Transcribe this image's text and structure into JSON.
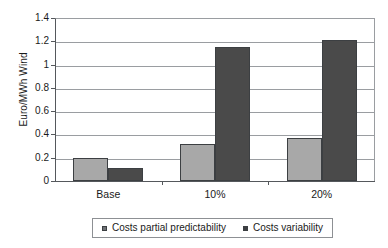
{
  "chart_data": {
    "type": "bar",
    "title": "",
    "subtitle": "",
    "xlabel": "",
    "ylabel": "Euro/MWh Wind",
    "categories": [
      "Base",
      "10%",
      "20%"
    ],
    "series": [
      {
        "name": "Costs partial predictability",
        "values": [
          0.2,
          0.32,
          0.37
        ],
        "color": "#a8a8a8"
      },
      {
        "name": "Costs variability",
        "values": [
          0.11,
          1.15,
          1.21
        ],
        "color": "#4a4a4a"
      }
    ],
    "ylim": [
      0,
      1.4
    ],
    "ytick_labels": [
      "0",
      "0.2",
      "0.4",
      "0.6",
      "0.8",
      "1",
      "1.2",
      "1.4"
    ],
    "ytick_values": [
      0,
      0.2,
      0.4,
      0.6,
      0.8,
      1.0,
      1.2,
      1.4
    ],
    "grid": true,
    "grid_axis": "y",
    "legend_position": "bottom"
  },
  "legend": {
    "items": [
      {
        "label": "Costs partial predictability"
      },
      {
        "label": "Costs variability"
      }
    ]
  }
}
